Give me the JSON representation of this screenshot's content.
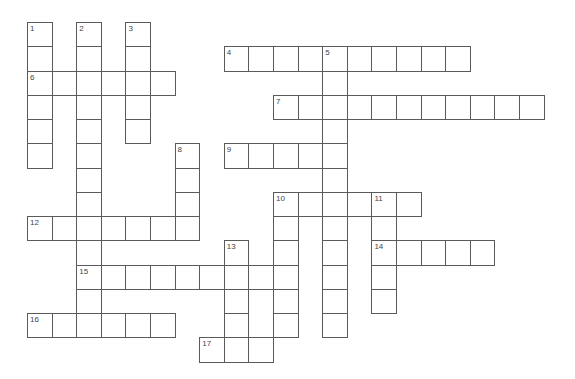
{
  "puzzle": {
    "type": "crossword",
    "grid": {
      "origin_x": 27,
      "origin_y": 22,
      "cell_w": 24.6,
      "cell_h": 24.25,
      "border_color": "#5a5a5a",
      "number_color": "#444444",
      "background": "#ffffff"
    },
    "entries": [
      {
        "number": "1",
        "direction": "down",
        "col": 0,
        "row": 0,
        "length": 6
      },
      {
        "number": "2",
        "direction": "down",
        "col": 2,
        "row": 0,
        "length": 13
      },
      {
        "number": "3",
        "direction": "down",
        "col": 4,
        "row": 0,
        "length": 5
      },
      {
        "number": "4",
        "direction": "across",
        "col": 8,
        "row": 1,
        "length": 10
      },
      {
        "number": "5",
        "direction": "down",
        "col": 12,
        "row": 1,
        "length": 12
      },
      {
        "number": "6",
        "direction": "across",
        "col": 0,
        "row": 2,
        "length": 6
      },
      {
        "number": "7",
        "direction": "across",
        "col": 10,
        "row": 3,
        "length": 11
      },
      {
        "number": "8",
        "direction": "down",
        "col": 6,
        "row": 5,
        "length": 4
      },
      {
        "number": "9",
        "direction": "across",
        "col": 8,
        "row": 5,
        "length": 5
      },
      {
        "number": "10",
        "direction": "across",
        "col": 10,
        "row": 7,
        "length": 6
      },
      {
        "number": "10",
        "direction": "down",
        "col": 10,
        "row": 7,
        "length": 6
      },
      {
        "number": "11",
        "direction": "down",
        "col": 14,
        "row": 7,
        "length": 5
      },
      {
        "number": "12",
        "direction": "across",
        "col": 0,
        "row": 8,
        "length": 7
      },
      {
        "number": "13",
        "direction": "down",
        "col": 8,
        "row": 9,
        "length": 5
      },
      {
        "number": "14",
        "direction": "across",
        "col": 14,
        "row": 9,
        "length": 5
      },
      {
        "number": "15",
        "direction": "across",
        "col": 2,
        "row": 10,
        "length": 9
      },
      {
        "number": "16",
        "direction": "across",
        "col": 0,
        "row": 12,
        "length": 6
      },
      {
        "number": "17",
        "direction": "across",
        "col": 7,
        "row": 13,
        "length": 3
      }
    ]
  }
}
